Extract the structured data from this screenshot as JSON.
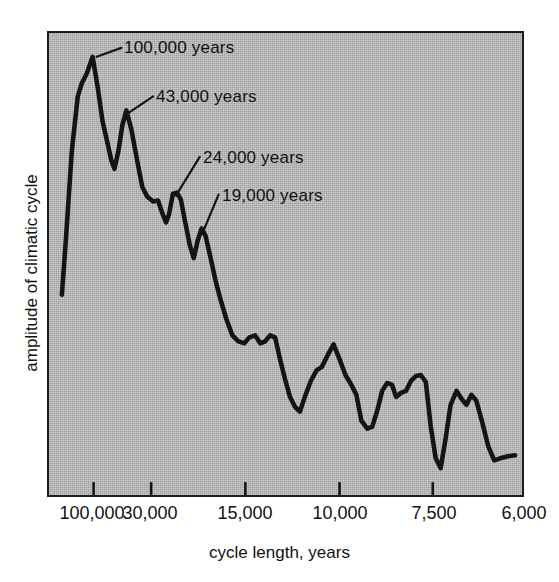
{
  "figure": {
    "background_color": "#ffffff",
    "panel_color": "#b4b4b4",
    "line_color": "#141414",
    "text_color": "#111111"
  },
  "axes": {
    "x_title": "cycle length, years",
    "y_title": "amplitude of climatic cycle"
  },
  "chart_data": {
    "type": "line",
    "title": "",
    "xlabel": "cycle length, years",
    "ylabel": "amplitude of climatic cycle",
    "grid": false,
    "legend": "none",
    "x_tick_labels": [
      "100,000",
      "30,000",
      "15,000",
      "10,000",
      "7,500",
      "6,000"
    ],
    "x_tick_positions_px": [
      92,
      150,
      245,
      340,
      434,
      524
    ],
    "x_axis_note": "axis runs from long cycles (left) to short cycles (right); scale is not linear in years",
    "ylim_note": "vertical axis is unlabeled spectral amplitude, arbitrary units",
    "annotations": [
      {
        "label": "100,000 years",
        "peak_x_px": 91,
        "peak_y_px": 55,
        "text_x_px": 124,
        "text_y_px": 38
      },
      {
        "label": "43,000 years",
        "peak_x_px": 125,
        "peak_y_px": 109,
        "text_x_px": 156,
        "text_y_px": 87
      },
      {
        "label": "24,000 years",
        "peak_x_px": 172,
        "peak_y_px": 193,
        "text_x_px": 203,
        "text_y_px": 148
      },
      {
        "label": "19,000 years",
        "peak_x_px": 201,
        "peak_y_px": 228,
        "text_x_px": 222,
        "text_y_px": 186
      }
    ],
    "series": [
      {
        "name": "climatic spectrum amplitude",
        "points_px": [
          [
            60,
            295
          ],
          [
            64,
            240
          ],
          [
            70,
            150
          ],
          [
            76,
            95
          ],
          [
            80,
            82
          ],
          [
            85,
            72
          ],
          [
            91,
            55
          ],
          [
            96,
            85
          ],
          [
            101,
            120
          ],
          [
            106,
            142
          ],
          [
            110,
            160
          ],
          [
            113,
            168
          ],
          [
            117,
            150
          ],
          [
            121,
            124
          ],
          [
            125,
            109
          ],
          [
            130,
            128
          ],
          [
            136,
            160
          ],
          [
            141,
            186
          ],
          [
            146,
            196
          ],
          [
            152,
            201
          ],
          [
            157,
            200
          ],
          [
            161,
            212
          ],
          [
            165,
            222
          ],
          [
            168,
            214
          ],
          [
            172,
            193
          ],
          [
            176,
            192
          ],
          [
            180,
            199
          ],
          [
            184,
            220
          ],
          [
            189,
            245
          ],
          [
            193,
            258
          ],
          [
            197,
            240
          ],
          [
            201,
            228
          ],
          [
            205,
            236
          ],
          [
            210,
            258
          ],
          [
            215,
            281
          ],
          [
            220,
            300
          ],
          [
            226,
            320
          ],
          [
            232,
            336
          ],
          [
            238,
            342
          ],
          [
            244,
            344
          ],
          [
            249,
            338
          ],
          [
            255,
            336
          ],
          [
            260,
            344
          ],
          [
            265,
            342
          ],
          [
            270,
            336
          ],
          [
            275,
            338
          ],
          [
            280,
            360
          ],
          [
            285,
            380
          ],
          [
            290,
            398
          ],
          [
            295,
            408
          ],
          [
            300,
            413
          ],
          [
            305,
            398
          ],
          [
            311,
            382
          ],
          [
            317,
            371
          ],
          [
            322,
            368
          ],
          [
            328,
            356
          ],
          [
            334,
            345
          ],
          [
            340,
            360
          ],
          [
            346,
            376
          ],
          [
            352,
            386
          ],
          [
            357,
            396
          ],
          [
            362,
            422
          ],
          [
            368,
            430
          ],
          [
            373,
            428
          ],
          [
            378,
            412
          ],
          [
            383,
            392
          ],
          [
            388,
            384
          ],
          [
            393,
            386
          ],
          [
            397,
            398
          ],
          [
            402,
            394
          ],
          [
            407,
            392
          ],
          [
            412,
            382
          ],
          [
            417,
            377
          ],
          [
            422,
            376
          ],
          [
            427,
            383
          ],
          [
            432,
            428
          ],
          [
            437,
            460
          ],
          [
            442,
            470
          ],
          [
            447,
            440
          ],
          [
            452,
            406
          ],
          [
            458,
            392
          ],
          [
            463,
            400
          ],
          [
            468,
            406
          ],
          [
            473,
            396
          ],
          [
            478,
            402
          ],
          [
            484,
            424
          ],
          [
            490,
            448
          ],
          [
            496,
            462
          ],
          [
            502,
            460
          ],
          [
            510,
            458
          ],
          [
            517,
            457
          ]
        ]
      }
    ]
  }
}
